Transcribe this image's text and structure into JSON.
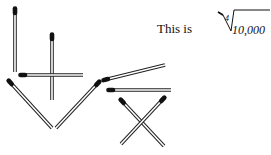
{
  "puzzle": {
    "caption": "This is",
    "radical_index": "4",
    "radicand": "10,000"
  },
  "colors": {
    "stick_outline": "#222222",
    "stick_fill": "#ffffff",
    "head": "#111111",
    "text": "#111111"
  },
  "matchsticks": [
    {
      "id": "a",
      "head": [
        15,
        9
      ],
      "tail": [
        15,
        72
      ]
    },
    {
      "id": "b",
      "head": [
        52,
        35
      ],
      "tail": [
        52,
        100
      ]
    },
    {
      "id": "c",
      "head": [
        21,
        75
      ],
      "tail": [
        83,
        75
      ]
    },
    {
      "id": "d",
      "head": [
        9,
        81
      ],
      "tail": [
        52,
        128
      ]
    },
    {
      "id": "e",
      "head": [
        99,
        82
      ],
      "tail": [
        56,
        128
      ]
    },
    {
      "id": "f",
      "head": [
        104,
        80
      ],
      "tail": [
        165,
        65
      ]
    },
    {
      "id": "g",
      "head": [
        109,
        90
      ],
      "tail": [
        171,
        90
      ]
    },
    {
      "id": "h",
      "head": [
        121,
        100
      ],
      "tail": [
        164,
        146
      ]
    },
    {
      "id": "i",
      "head": [
        164,
        98
      ],
      "tail": [
        121,
        144
      ]
    }
  ]
}
